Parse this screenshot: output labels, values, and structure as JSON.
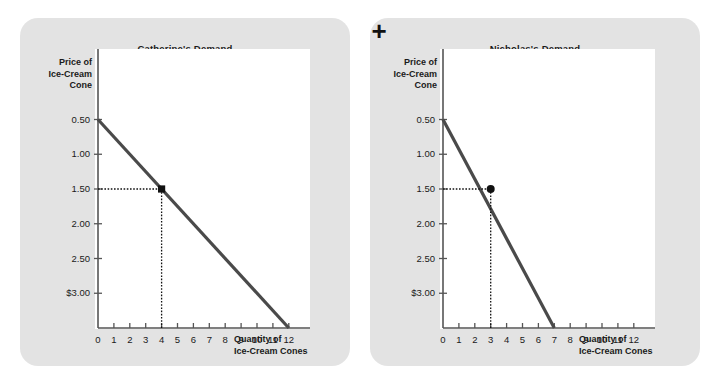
{
  "figure": {
    "operator": "+",
    "background_color": "#ffffff",
    "card_color": "#e3e3e3",
    "curve_color": "#4a4a4a",
    "axis_color": "#555555",
    "marker_color": "#111111"
  },
  "panels": [
    {
      "id": "catherine",
      "title": "Catherine's Demand",
      "ylabel_lines": [
        "Price of",
        "Ice-Cream",
        "Cone"
      ],
      "xlabel_lines": [
        "Quantity of",
        "Ice-Cream Cones"
      ],
      "yticks": [
        "$3.00",
        "2.50",
        "2.00",
        "1.50",
        "1.00",
        "0.50"
      ],
      "xticks": [
        "0",
        "1",
        "2",
        "3",
        "4",
        "5",
        "6",
        "7",
        "8",
        "9",
        "10",
        "11",
        "12"
      ]
    },
    {
      "id": "nicholas",
      "title": "Nicholas's Demand",
      "ylabel_lines": [
        "Price of",
        "Ice-Cream",
        "Cone"
      ],
      "xlabel_lines": [
        "Quantity of",
        "Ice-Cream Cones"
      ],
      "yticks": [
        "$3.00",
        "2.50",
        "2.00",
        "1.50",
        "1.00",
        "0.50"
      ],
      "xticks": [
        "0",
        "1",
        "2",
        "3",
        "4",
        "5",
        "6",
        "7",
        "8",
        "9",
        "10",
        "11",
        "12"
      ]
    }
  ],
  "chart_data": [
    {
      "type": "line",
      "title": "Catherine's Demand",
      "xlabel": "Quantity of Ice-Cream Cones",
      "ylabel": "Price of Ice-Cream Cone",
      "xlim": [
        0,
        12
      ],
      "ylim": [
        0,
        3.25
      ],
      "xticks": [
        0,
        1,
        2,
        3,
        4,
        5,
        6,
        7,
        8,
        9,
        10,
        11,
        12
      ],
      "yticks": [
        0.5,
        1.0,
        1.5,
        2.0,
        2.5,
        3.0
      ],
      "ytick_labels": [
        "0.50",
        "1.00",
        "1.50",
        "2.00",
        "2.50",
        "$3.00"
      ],
      "grid": false,
      "legend": "none",
      "series": [
        {
          "name": "Catherine's demand curve",
          "x": [
            0,
            12
          ],
          "y": [
            3.0,
            0.0
          ]
        }
      ],
      "annotations": [
        {
          "kind": "marker-point",
          "shape": "square",
          "x": 4,
          "y": 2.0,
          "guides": [
            "horizontal-dotted-to-y-axis",
            "vertical-dotted-to-x-axis"
          ]
        }
      ]
    },
    {
      "type": "line",
      "title": "Nicholas's Demand",
      "xlabel": "Quantity of Ice-Cream Cones",
      "ylabel": "Price of Ice-Cream Cone",
      "xlim": [
        0,
        12
      ],
      "ylim": [
        0,
        3.25
      ],
      "xticks": [
        0,
        1,
        2,
        3,
        4,
        5,
        6,
        7,
        8,
        9,
        10,
        11,
        12
      ],
      "yticks": [
        0.5,
        1.0,
        1.5,
        2.0,
        2.5,
        3.0
      ],
      "ytick_labels": [
        "0.50",
        "1.00",
        "1.50",
        "2.00",
        "2.50",
        "$3.00"
      ],
      "grid": false,
      "legend": "none",
      "series": [
        {
          "name": "Nicholas's demand curve",
          "x": [
            0,
            7
          ],
          "y": [
            3.0,
            0.0
          ]
        }
      ],
      "annotations": [
        {
          "kind": "marker-point",
          "shape": "circle",
          "x": 3,
          "y": 2.0,
          "guides": [
            "horizontal-dotted-to-y-axis",
            "vertical-dotted-to-x-axis"
          ]
        }
      ]
    }
  ]
}
